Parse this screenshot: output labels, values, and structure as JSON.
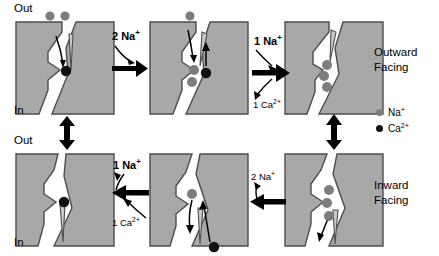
{
  "figure": {
    "colors": {
      "protein_fill": "#a8a8a8",
      "protein_stroke": "#4d4d4d",
      "na_ion": "#7d7d7d",
      "ca_ion": "#111111",
      "background": "#ffffff",
      "arrow": "#000000"
    }
  },
  "membrane_labels": {
    "outside_top": "Out",
    "inside_top": "In",
    "outside_bottom": "Out",
    "inside_bottom": "In"
  },
  "state_labels": {
    "outward": {
      "line1": "Outward",
      "line2": "Facing"
    },
    "inward": {
      "line1": "Inward",
      "line2": "Facing"
    }
  },
  "legend": {
    "items": [
      {
        "label": "Na",
        "charge": "+",
        "color": "#7d7d7d",
        "name": "sodium"
      },
      {
        "label": "Ca",
        "charge": "2+",
        "color": "#111111",
        "name": "calcium"
      }
    ]
  },
  "transitions": {
    "top_left_to_mid": {
      "label": "2 Na",
      "charge": "+",
      "direction": "right"
    },
    "top_mid_to_right": {
      "label_in": "1 Na",
      "charge_in": "+",
      "label_out": "1 Ca",
      "charge_out": "2+",
      "direction": "right"
    },
    "bottom_right_to_mid": {
      "label": "2 Na",
      "charge": "+",
      "direction": "left"
    },
    "bottom_mid_to_left": {
      "label_in": "1 Na",
      "charge_in": "+",
      "label_out": "1 Ca",
      "charge_out": "2+",
      "direction": "left"
    },
    "left_vertical": {
      "direction": "both"
    },
    "right_vertical": {
      "direction": "both"
    }
  },
  "panels": [
    {
      "id": "top-1",
      "row": "top",
      "index": 1,
      "state": "outward-facing",
      "bound_ions": [
        {
          "type": "Ca2+",
          "color": "#111111"
        }
      ],
      "free_ions": [
        {
          "type": "Na+",
          "color": "#7d7d7d",
          "position": "extracellular"
        },
        {
          "type": "Na+",
          "color": "#7d7d7d",
          "position": "extracellular"
        }
      ],
      "description": "Outward-facing with one Ca2+ bound, two Na+ approaching from outside"
    },
    {
      "id": "top-2",
      "row": "top",
      "index": 2,
      "state": "outward-facing-exchange",
      "bound_ions": [
        {
          "type": "Na+",
          "color": "#7d7d7d"
        },
        {
          "type": "Na+",
          "color": "#7d7d7d"
        },
        {
          "type": "Ca2+",
          "color": "#111111"
        }
      ],
      "free_ions": [
        {
          "type": "Na+",
          "color": "#7d7d7d",
          "position": "extracellular"
        }
      ],
      "description": "Na+ binding while Ca2+ is released to the outside"
    },
    {
      "id": "top-3",
      "row": "top",
      "index": 3,
      "state": "outward-facing-na-loaded",
      "bound_ions": [
        {
          "type": "Na+",
          "color": "#7d7d7d"
        },
        {
          "type": "Na+",
          "color": "#7d7d7d"
        },
        {
          "type": "Na+",
          "color": "#7d7d7d"
        }
      ],
      "free_ions": [],
      "description": "Three Na+ bound, outward facing"
    },
    {
      "id": "bottom-3",
      "row": "bottom",
      "index": 3,
      "state": "inward-facing-na-loaded",
      "bound_ions": [
        {
          "type": "Na+",
          "color": "#7d7d7d"
        },
        {
          "type": "Na+",
          "color": "#7d7d7d"
        },
        {
          "type": "Na+",
          "color": "#7d7d7d"
        }
      ],
      "free_ions": [],
      "description": "Three Na+ bound, inward facing, one releasing to cytoplasm"
    },
    {
      "id": "bottom-2",
      "row": "bottom",
      "index": 2,
      "state": "inward-facing-exchange",
      "bound_ions": [
        {
          "type": "Na+",
          "color": "#7d7d7d"
        }
      ],
      "free_ions": [
        {
          "type": "Ca2+",
          "color": "#111111",
          "position": "intracellular"
        }
      ],
      "description": "Last Na+ released inward while Ca2+ enters from the cytoplasm"
    },
    {
      "id": "bottom-1",
      "row": "bottom",
      "index": 1,
      "state": "inward-facing-ca-loaded",
      "bound_ions": [
        {
          "type": "Ca2+",
          "color": "#111111"
        }
      ],
      "free_ions": [],
      "description": "Inward facing with one Ca2+ bound"
    }
  ]
}
